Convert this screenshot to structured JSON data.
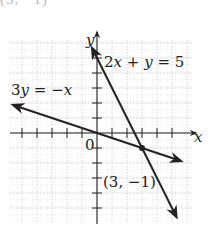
{
  "top_cropped_text": "(3, −1)",
  "graph": {
    "origin_px": [
      97,
      133
    ],
    "unit_px": 15,
    "x_range": [
      -5.8,
      6.3
    ],
    "y_range": [
      -6,
      6.2
    ],
    "axis_labels": {
      "x": "x",
      "y": "y",
      "origin": "0"
    },
    "lines": [
      {
        "name": "2x + y = 5",
        "label_parts": [
          "2",
          "x",
          " + ",
          "y",
          " = 5"
        ],
        "slope": -2,
        "intercept": 5,
        "color": "#222222"
      },
      {
        "name": "3y = −x",
        "label_parts": [
          "3",
          "y",
          " = −",
          "x"
        ],
        "slope": -0.3333,
        "intercept": 0,
        "color": "#222222"
      }
    ],
    "intersection": {
      "x": 3,
      "y": -1,
      "label": "(3, −1)"
    },
    "grid_color": "#c8c8c8",
    "axis_color": "#222222"
  },
  "chart_data": {
    "type": "line",
    "title": "",
    "xlabel": "x",
    "ylabel": "y",
    "xlim": [
      -5.8,
      6.3
    ],
    "ylim": [
      -6,
      6.2
    ],
    "grid": true,
    "series": [
      {
        "name": "2x + y = 5",
        "x": [
          -0.33,
          5.3
        ],
        "y": [
          5.67,
          -5.6
        ]
      },
      {
        "name": "3y = −x",
        "x": [
          -5.6,
          5.6
        ],
        "y": [
          1.87,
          -1.87
        ]
      }
    ],
    "annotations": [
      {
        "text": "2x + y = 5",
        "x": 0.3,
        "y": 5
      },
      {
        "text": "3y = −x",
        "x": -5.6,
        "y": 2.4
      },
      {
        "text": "(3, −1)",
        "x": 3,
        "y": -1
      },
      {
        "text": "0",
        "x": 0,
        "y": 0
      }
    ]
  }
}
